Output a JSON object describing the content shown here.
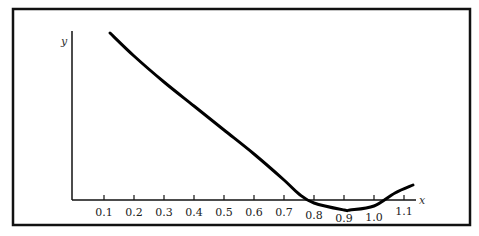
{
  "chart_data": {
    "type": "line",
    "title": "",
    "xlabel": "x",
    "ylabel": "y",
    "xlim": [
      0.0,
      1.15
    ],
    "grid": false,
    "legend": null,
    "x_ticks": [
      0.1,
      0.2,
      0.3,
      0.4,
      0.5,
      0.6,
      0.7,
      0.8,
      0.9,
      1.0,
      1.1
    ],
    "x_tick_labels": [
      "0.1",
      "0.2",
      "0.3",
      "0.4",
      "0.5",
      "0.6",
      "0.7",
      "0.8",
      "0.9",
      "1.0",
      "1.1"
    ],
    "y_ticks": [],
    "series": [
      {
        "name": "curve",
        "color": "#000000",
        "x": [
          0.12,
          0.2,
          0.3,
          0.4,
          0.5,
          0.6,
          0.7,
          0.75,
          0.8,
          0.9,
          0.92,
          1.0,
          1.07,
          1.13
        ],
        "y_px": [
          33,
          56,
          82,
          106,
          130,
          154,
          180,
          194,
          203,
          210,
          210,
          206,
          193,
          185
        ]
      }
    ],
    "annotations": [
      "Curve crosses x-axis near x≈0.75 and x≈1.07; minimum near x≈0.92 (below axis)"
    ]
  },
  "labels": {
    "x_axis": "x",
    "y_axis": "y",
    "ticks": [
      "0.1",
      "0.2",
      "0.3",
      "0.4",
      "0.5",
      "0.6",
      "0.7",
      "0.8",
      "0.9",
      "1.0",
      "1.1"
    ]
  }
}
